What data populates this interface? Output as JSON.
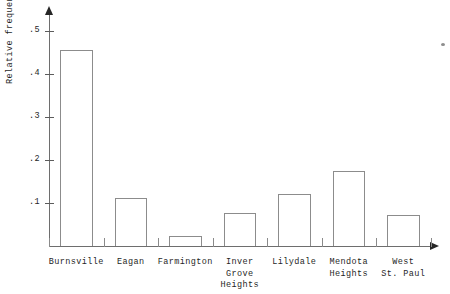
{
  "chart_data": {
    "type": "bar",
    "title": "",
    "subtitle": "",
    "xlabel": "",
    "ylabel": "Relative frequency",
    "categories": [
      "Burnsville",
      "Eagan",
      "Farmington",
      "Inver\nGrove\nHeights",
      "Lilydale",
      "Mendota\nHeights",
      "West\nSt. Paul"
    ],
    "values": [
      0.455,
      0.112,
      0.023,
      0.077,
      0.12,
      0.174,
      0.073
    ],
    "ylim": [
      0,
      0.53
    ],
    "ytick_values": [
      0.1,
      0.2,
      0.3,
      0.4,
      0.5
    ],
    "ytick_labels": [
      ".1",
      ".2",
      ".3",
      ".4",
      ".5"
    ],
    "grid": false,
    "legend": null,
    "bar_style": "outlined-unfilled",
    "colors": {
      "bar_outline": "#8c8c8c",
      "bar_fill": "transparent",
      "axis": "#6e6e6e",
      "text": "#1f1f1f",
      "background": "#ffffff"
    }
  },
  "axis_labels": {
    "y": "Relative frequency"
  },
  "ticks": {
    "y": [
      {
        "label": ".5",
        "value": 0.5
      },
      {
        "label": ".4",
        "value": 0.4
      },
      {
        "label": ".3",
        "value": 0.3
      },
      {
        "label": ".2",
        "value": 0.2
      },
      {
        "label": ".1",
        "value": 0.1
      }
    ]
  },
  "bars": [
    {
      "label": "Burnsville",
      "value": 0.455
    },
    {
      "label": "Eagan",
      "value": 0.112
    },
    {
      "label": "Farmington",
      "value": 0.023
    },
    {
      "label": "Inver\nGrove\nHeights",
      "value": 0.077
    },
    {
      "label": "Lilydale",
      "value": 0.12
    },
    {
      "label": "Mendota\nHeights",
      "value": 0.174
    },
    {
      "label": "West\nSt. Paul",
      "value": 0.073
    }
  ]
}
